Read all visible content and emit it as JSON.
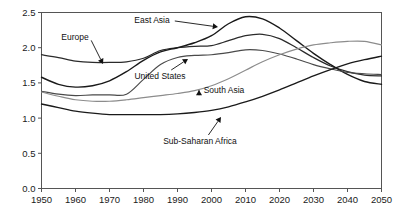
{
  "chart_data": {
    "type": "line",
    "title": "",
    "subtitle": "",
    "xlabel": "",
    "ylabel": "",
    "xlim": [
      1950,
      2050
    ],
    "ylim": [
      0.0,
      2.5
    ],
    "grid": false,
    "legend_position": "inline-annotations",
    "x_ticks": [
      "1950",
      "1960",
      "1970",
      "1980",
      "1990",
      "2000",
      "2010",
      "2020",
      "2030",
      "2040",
      "2050"
    ],
    "y_ticks": [
      "0.0",
      "0.5",
      "1.0",
      "1.5",
      "2.0",
      "2.5"
    ],
    "x": [
      1950,
      1955,
      1960,
      1965,
      1970,
      1975,
      1980,
      1985,
      1990,
      1995,
      2000,
      2005,
      2010,
      2015,
      2020,
      2025,
      2030,
      2035,
      2040,
      2045,
      2050
    ],
    "series": [
      {
        "name": "Europe",
        "color": "#2b2b2b",
        "width": 1.25,
        "values": [
          1.9,
          1.86,
          1.81,
          1.79,
          1.79,
          1.8,
          1.85,
          1.96,
          2.0,
          2.02,
          2.03,
          2.1,
          2.17,
          2.19,
          2.13,
          2.0,
          1.86,
          1.74,
          1.66,
          1.61,
          1.6
        ]
      },
      {
        "name": "East Asia",
        "color": "#1a1a1a",
        "width": 1.4,
        "values": [
          1.58,
          1.48,
          1.44,
          1.46,
          1.53,
          1.66,
          1.82,
          1.94,
          2.0,
          2.07,
          2.17,
          2.34,
          2.44,
          2.41,
          2.28,
          2.1,
          1.92,
          1.76,
          1.62,
          1.52,
          1.48
        ]
      },
      {
        "name": "United States",
        "color": "#4a4a4a",
        "width": 1.15,
        "values": [
          1.38,
          1.34,
          1.32,
          1.33,
          1.33,
          1.34,
          1.55,
          1.76,
          1.86,
          1.89,
          1.9,
          1.93,
          1.97,
          1.96,
          1.91,
          1.84,
          1.76,
          1.7,
          1.65,
          1.63,
          1.62
        ]
      },
      {
        "name": "South Asia",
        "color": "#8c8c8c",
        "width": 1.15,
        "values": [
          1.37,
          1.31,
          1.26,
          1.24,
          1.24,
          1.26,
          1.29,
          1.32,
          1.35,
          1.39,
          1.46,
          1.56,
          1.68,
          1.8,
          1.9,
          1.98,
          2.04,
          2.07,
          2.09,
          2.09,
          2.04
        ]
      },
      {
        "name": "Sub-Saharan Africa",
        "color": "#1a1a1a",
        "width": 1.35,
        "values": [
          1.2,
          1.15,
          1.1,
          1.07,
          1.05,
          1.05,
          1.05,
          1.05,
          1.06,
          1.08,
          1.11,
          1.16,
          1.23,
          1.31,
          1.4,
          1.5,
          1.6,
          1.69,
          1.77,
          1.83,
          1.88
        ]
      }
    ],
    "annotations": [
      {
        "name": "europe",
        "label": "Europe",
        "text_x": 75,
        "text_y": 40,
        "arrow_to_x": 103,
        "arrow_to_y": 64
      },
      {
        "name": "east-asia",
        "label": "East Asia",
        "text_x": 152,
        "text_y": 23,
        "arrow_to_x": 218,
        "arrow_to_y": 27
      },
      {
        "name": "united-states",
        "label": "United States",
        "text_x": 160,
        "text_y": 79,
        "arrow_to_x": 188,
        "arrow_to_y": 59
      },
      {
        "name": "south-asia",
        "label": "South Asia",
        "text_x": 224,
        "text_y": 93,
        "arrow_to_x": 199,
        "arrow_to_y": 90
      },
      {
        "name": "sub-saharan-africa",
        "label": "Sub-Saharan Africa",
        "text_x": 200,
        "text_y": 144,
        "arrow_to_x": 221,
        "arrow_to_y": 117
      }
    ]
  },
  "axes": {
    "y_tick_values": [
      0.0,
      0.5,
      1.0,
      1.5,
      2.0,
      2.5
    ],
    "x_tick_values": [
      1950,
      1960,
      1970,
      1980,
      1990,
      2000,
      2010,
      2020,
      2030,
      2040,
      2050
    ]
  }
}
